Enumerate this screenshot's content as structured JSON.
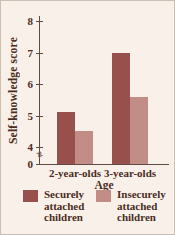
{
  "figure": {
    "background": "#f9f1e9",
    "text_color": "#4a2d24",
    "axis_color": "#5d4a40",
    "break_glyph": "≈"
  },
  "chart_data": {
    "type": "bar",
    "title": "",
    "ylabel": "Self-knowledge score",
    "xlabel": "Age",
    "categories": [
      "2-year-olds",
      "3-year-olds"
    ],
    "series": [
      {
        "name": "Securely attached children",
        "legend_label": "Securely\nattached\nchildren",
        "color": "#98504d",
        "values": [
          5.1,
          7.0
        ]
      },
      {
        "name": "Insecurely attached children",
        "legend_label": "Insecurely\nattached\nchildren",
        "color": "#c18d86",
        "values": [
          4.5,
          5.6
        ]
      }
    ],
    "yticks": [
      0,
      4,
      5,
      6,
      7,
      8
    ],
    "axis_break": true,
    "ylim_display": [
      4,
      8
    ],
    "grid": false,
    "legend_position": "bottom"
  }
}
